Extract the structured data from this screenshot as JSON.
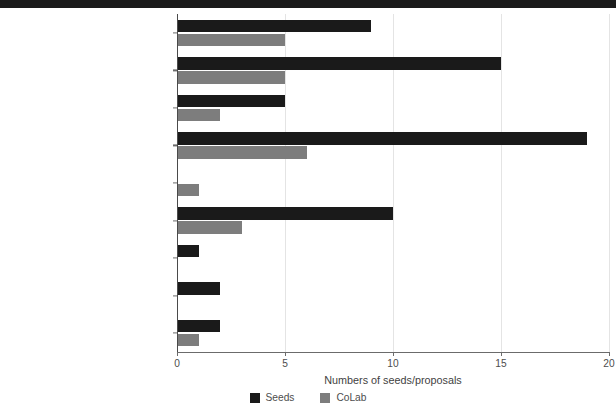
{
  "chart_data": {
    "type": "bar",
    "orientation": "horizontal",
    "title": "",
    "xlabel": "Numbers of seeds/proposals",
    "ylabel": "",
    "xlim": [
      0,
      20
    ],
    "xticks": [
      "0",
      "5",
      "10",
      "15",
      "20"
    ],
    "xtick_values": [
      0,
      5,
      10,
      15,
      20
    ],
    "grid": "vertical",
    "legend_position": "bottom-center",
    "categories": [
      "Energy access",
      "Behavioural change",
      "End-use electrification",
      "Low/zero emission technologies",
      "Bioenergy (with and without CCS)",
      "Improve energy efficiency",
      "Negative emissions technologies (NET)",
      "Air pollution control",
      "Non-CO₂ Emissions Reduction"
    ],
    "series": [
      {
        "name": "Seeds",
        "color": "#1a1a1a",
        "values": [
          9,
          15,
          5,
          19,
          0,
          10,
          1,
          2,
          2
        ]
      },
      {
        "name": "CoLab",
        "color": "#7d7d7d",
        "values": [
          5,
          5,
          2,
          6,
          1,
          3,
          0,
          0,
          1
        ]
      }
    ]
  },
  "legend": {
    "items": [
      {
        "label": "Seeds",
        "color": "#1a1a1a"
      },
      {
        "label": "CoLab",
        "color": "#7d7d7d"
      }
    ]
  },
  "axis": {
    "x_title": "Numbers of seeds/proposals"
  },
  "style": {
    "banner_color": "#1b1b1b",
    "grid_color": "#e4e4e4",
    "axis_color": "#6b6b6b",
    "text_color": "#4d4d4d"
  }
}
